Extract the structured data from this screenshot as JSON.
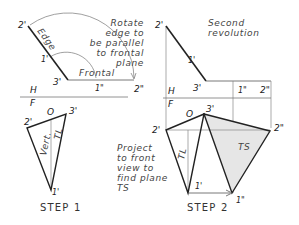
{
  "figure": {
    "step1": {
      "caption": "STEP 1",
      "top_labels": {
        "p2": "2'",
        "p1": "1'",
        "p3": "3'",
        "p1pp": "1\"",
        "p2pp": "2\"",
        "edge": "Edge",
        "frontal": "Frontal"
      },
      "note_lines": [
        "Rotate",
        "edge to",
        "be parallel",
        "to frontal",
        "plane"
      ],
      "fold": {
        "h": "H",
        "f": "F"
      },
      "bottom_labels": {
        "p2": "2'",
        "o": "O",
        "p3": "3'",
        "p1": "1'",
        "vert": "Vert.",
        "tl": "TL"
      }
    },
    "step2": {
      "caption": "STEP 2",
      "top_labels": {
        "p2": "2'",
        "p1": "1'",
        "p3": "3'",
        "p1pp": "1\"",
        "p2pp": "2\""
      },
      "note_lines": [
        "Second",
        "revolution"
      ],
      "fold": {
        "h": "H",
        "f": "F"
      },
      "bottom_labels": {
        "p2": "2'",
        "o": "O",
        "p3": "3'",
        "p2pp": "2\"",
        "p1": "1'",
        "p1pp": "1\"",
        "tl": "TL",
        "ts": "TS"
      },
      "note2_lines": [
        "Project",
        "to front",
        "view to",
        "find plane",
        "TS"
      ]
    },
    "colors": {
      "line": "#222222",
      "thin": "#777777",
      "shade": "#e6e6e6"
    }
  }
}
